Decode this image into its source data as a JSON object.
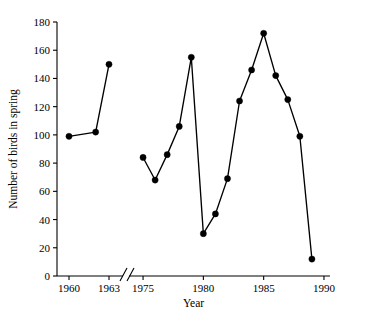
{
  "chart_data": {
    "type": "line",
    "title": "",
    "xlabel": "Year",
    "ylabel": "Number of birds in spring",
    "xlim": [
      1959,
      1990
    ],
    "ylim": [
      0,
      180
    ],
    "grid": false,
    "legend": null,
    "axis_break": {
      "present": true,
      "between": [
        1963,
        1975
      ],
      "style": "double-slash"
    },
    "yticks": [
      0,
      20,
      40,
      60,
      80,
      100,
      120,
      140,
      160,
      180
    ],
    "ytick_labels": [
      "0",
      "20",
      "40",
      "60",
      "80",
      "100",
      "120",
      "140",
      "160",
      "180"
    ],
    "xticks": [
      1960,
      1963,
      1975,
      1980,
      1985,
      1990
    ],
    "xtick_labels": [
      "1960",
      "1963",
      "1975",
      "1980",
      "1985",
      "1990"
    ],
    "marker": "filled-circle",
    "series": [
      {
        "name": "Birds in spring (early)",
        "x": [
          1960,
          1962,
          1963
        ],
        "values": [
          99,
          102,
          150
        ]
      },
      {
        "name": "Birds in spring (late)",
        "x": [
          1975,
          1976,
          1977,
          1978,
          1979,
          1980,
          1981,
          1982,
          1983,
          1984,
          1985,
          1986,
          1987,
          1988,
          1989
        ],
        "values": [
          84,
          68,
          86,
          106,
          155,
          30,
          44,
          69,
          124,
          146,
          172,
          142,
          125,
          99,
          12
        ]
      }
    ],
    "colors": {
      "line": "#000000",
      "marker": "#000000",
      "axis": "#000000",
      "background": "#ffffff"
    }
  }
}
